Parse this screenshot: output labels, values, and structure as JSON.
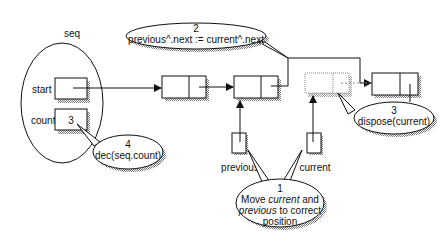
{
  "seq": {
    "label": "seq",
    "start_label": "start",
    "count_label": "count",
    "count_value": "3"
  },
  "callouts": {
    "step1": {
      "number": "1",
      "line1_em": "current",
      "line1_pre": "Move ",
      "line1_post": " and",
      "line2_em": "previous",
      "line2_post": " to correct",
      "line3": "position"
    },
    "step2": {
      "number": "2",
      "text": "previous^.next := current^.next"
    },
    "step3": {
      "number": "3",
      "text": "dispose(current)"
    },
    "step4": {
      "number": "4",
      "text": "dec(seq.count)"
    }
  },
  "pointers": {
    "previous_label": "previous",
    "current_label": "current"
  },
  "colors": {
    "line": "#111111",
    "shadow": "#9a9a9a",
    "dotted": "#888888"
  }
}
